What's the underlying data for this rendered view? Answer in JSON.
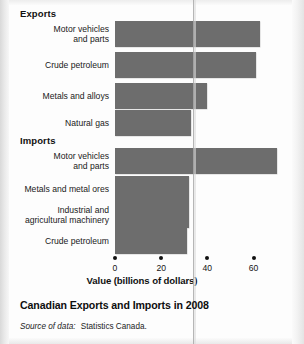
{
  "figure": {
    "title": "Canadian Exports and Imports in 2008",
    "source_lead": "Source of data:",
    "source_text": "Statistics Canada."
  },
  "colors": {
    "bar_fill": "#6d6d6d",
    "text": "#161616",
    "page_background": "#fdfdfd",
    "crease_line": "#a9a9a9"
  },
  "groups": [
    {
      "label": "Exports"
    },
    {
      "label": "Imports"
    }
  ],
  "axis": {
    "title": "Value (billions of dollars)",
    "ticks": [
      "0",
      "20",
      "40",
      "60"
    ],
    "tick_values": [
      0,
      20,
      40,
      60
    ],
    "min": 0,
    "max": 72
  },
  "chart_data": {
    "type": "bar",
    "orientation": "horizontal",
    "title": "Canadian Exports and Imports in 2008",
    "subtitle": "",
    "xlabel": "Value (billions of dollars)",
    "ylabel": "",
    "xlim": [
      0,
      72
    ],
    "xticks": [
      0,
      20,
      40,
      60
    ],
    "grid": false,
    "legend": "none",
    "units": "billions of dollars",
    "annotations": [
      "Source of data: Statistics Canada."
    ],
    "groups": [
      {
        "name": "Exports",
        "categories": [
          "Motor vehicles and parts",
          "Crude petroleum",
          "Metals and alloys",
          "Natural gas"
        ],
        "values": [
          63,
          61,
          40,
          33
        ]
      },
      {
        "name": "Imports",
        "categories": [
          "Motor vehicles and parts",
          "Metals and metal ores",
          "Industrial and agricultural machinery",
          "Crude petroleum"
        ],
        "values": [
          70,
          32,
          32,
          31
        ]
      }
    ],
    "categories": [
      "Motor vehicles and parts",
      "Crude petroleum",
      "Metals and alloys",
      "Natural gas",
      "Motor vehicles and parts",
      "Metals and metal ores",
      "Industrial and agricultural machinery",
      "Crude petroleum"
    ],
    "values": [
      63,
      61,
      40,
      33,
      70,
      32,
      32,
      31
    ]
  },
  "bars": [
    {
      "label_line1": "Motor vehicles",
      "label_line2": "and parts",
      "value": 63,
      "group": "Exports"
    },
    {
      "label_line1": "Crude petroleum",
      "label_line2": "",
      "value": 61,
      "group": "Exports"
    },
    {
      "label_line1": "Metals and alloys",
      "label_line2": "",
      "value": 40,
      "group": "Exports"
    },
    {
      "label_line1": "Natural gas",
      "label_line2": "",
      "value": 33,
      "group": "Exports"
    },
    {
      "label_line1": "Motor vehicles",
      "label_line2": "and parts",
      "value": 70,
      "group": "Imports"
    },
    {
      "label_line1": "Metals and metal ores",
      "label_line2": "",
      "value": 32,
      "group": "Imports"
    },
    {
      "label_line1": "Industrial and",
      "label_line2": "agricultural machinery",
      "value": 32,
      "group": "Imports"
    },
    {
      "label_line1": "Crude petroleum",
      "label_line2": "",
      "value": 31,
      "group": "Imports"
    }
  ]
}
